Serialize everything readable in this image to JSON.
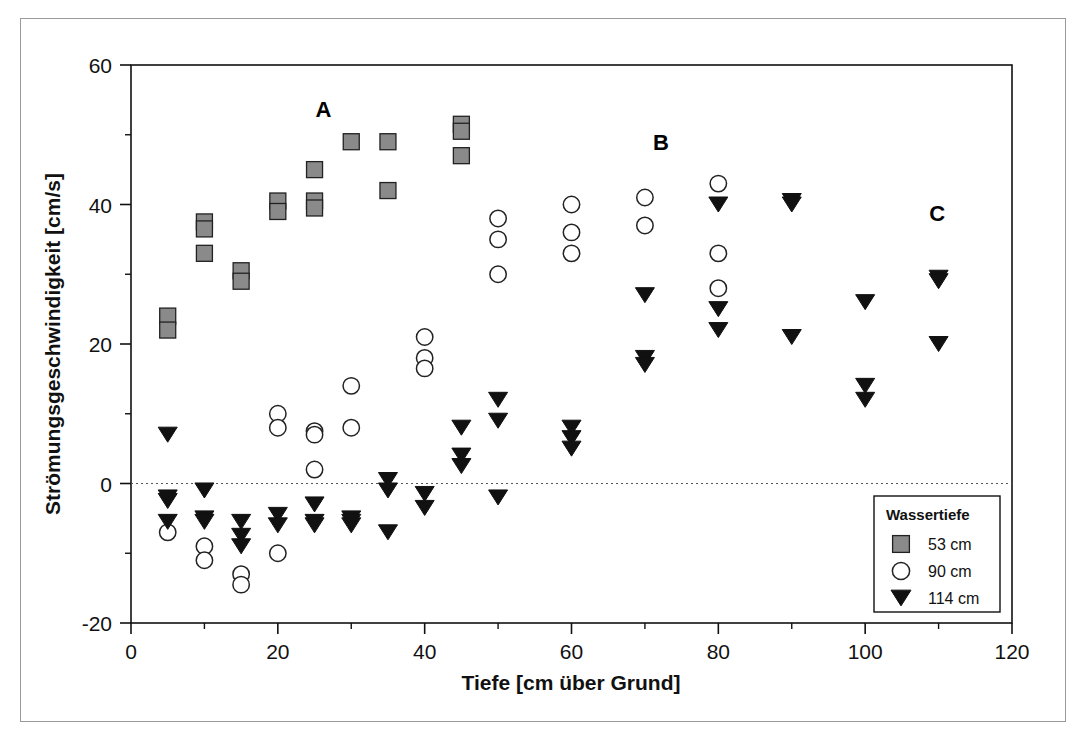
{
  "chart_data": {
    "type": "scatter",
    "title": "",
    "xlabel": "Tiefe [cm über Grund]",
    "ylabel": "Strömungsgeschwindigkeit [cm/s]",
    "xlim": [
      0,
      120
    ],
    "ylim": [
      -20,
      60
    ],
    "xticks": [
      0,
      20,
      40,
      60,
      80,
      100,
      120
    ],
    "xtick_labels": [
      "0",
      "20",
      "40",
      "60",
      "80",
      "100",
      "120"
    ],
    "xminor_ticks": [
      10,
      30,
      50,
      70,
      90,
      110
    ],
    "yticks": [
      -20,
      0,
      20,
      40,
      60
    ],
    "ytick_labels": [
      "-20",
      "0",
      "20",
      "40",
      "60"
    ],
    "yminor_ticks": [
      -10,
      10,
      30,
      50
    ],
    "grid": false,
    "zero_line": {
      "value": 0,
      "style": "dotted",
      "color": "#555555"
    },
    "legend": {
      "position": "bottom-right",
      "title": "Wassertiefe",
      "entries": [
        {
          "label": "53 cm",
          "marker": "square",
          "fill": "#8a8a8a",
          "stroke": "#222222"
        },
        {
          "label": "90 cm",
          "marker": "circle",
          "fill": "#ffffff",
          "stroke": "#222222"
        },
        {
          "label": "114 cm",
          "marker": "triangle-down",
          "fill": "#111111",
          "stroke": "#111111"
        }
      ]
    },
    "annotations": [
      {
        "text": "A",
        "x": 26.2,
        "y": 52.5
      },
      {
        "text": "B",
        "x": 72.2,
        "y": 47.8
      },
      {
        "text": "C",
        "x": 109.8,
        "y": 37.7
      }
    ],
    "series": [
      {
        "name": "53 cm",
        "marker": "square",
        "fill": "#8a8a8a",
        "stroke": "#222222",
        "points": [
          [
            5,
            24
          ],
          [
            5,
            22
          ],
          [
            10,
            37.5
          ],
          [
            10,
            36.5
          ],
          [
            10,
            33
          ],
          [
            15,
            30.5
          ],
          [
            15,
            29
          ],
          [
            20,
            40.5
          ],
          [
            20,
            39
          ],
          [
            25,
            45
          ],
          [
            25,
            40.5
          ],
          [
            25,
            39.5
          ],
          [
            30,
            49
          ],
          [
            35,
            49
          ],
          [
            35,
            42
          ],
          [
            45,
            51.5
          ],
          [
            45,
            50.5
          ],
          [
            45,
            47
          ]
        ]
      },
      {
        "name": "90 cm",
        "marker": "circle",
        "fill": "#ffffff",
        "stroke": "#222222",
        "points": [
          [
            5,
            -7
          ],
          [
            10,
            -9
          ],
          [
            10,
            -11
          ],
          [
            15,
            -13
          ],
          [
            15,
            -14.5
          ],
          [
            20,
            10
          ],
          [
            20,
            8
          ],
          [
            20,
            -10
          ],
          [
            25,
            7.5
          ],
          [
            25,
            7
          ],
          [
            25,
            2
          ],
          [
            30,
            14
          ],
          [
            30,
            8
          ],
          [
            40,
            21
          ],
          [
            40,
            18
          ],
          [
            40,
            16.5
          ],
          [
            50,
            38
          ],
          [
            50,
            35
          ],
          [
            50,
            30
          ],
          [
            60,
            40
          ],
          [
            60,
            36
          ],
          [
            60,
            33
          ],
          [
            70,
            41
          ],
          [
            70,
            37
          ],
          [
            80,
            43
          ],
          [
            80,
            33
          ],
          [
            80,
            28
          ]
        ]
      },
      {
        "name": "114 cm",
        "marker": "triangle-down",
        "fill": "#111111",
        "stroke": "#111111",
        "points": [
          [
            5,
            7
          ],
          [
            5,
            -2
          ],
          [
            5,
            -2.5
          ],
          [
            5,
            -5.5
          ],
          [
            10,
            -1
          ],
          [
            10,
            -5
          ],
          [
            10,
            -5.5
          ],
          [
            15,
            -5.5
          ],
          [
            15,
            -7.5
          ],
          [
            15,
            -9
          ],
          [
            20,
            -4.5
          ],
          [
            20,
            -6
          ],
          [
            25,
            -3
          ],
          [
            25,
            -5.5
          ],
          [
            25,
            -6
          ],
          [
            30,
            -5
          ],
          [
            30,
            -5.5
          ],
          [
            30,
            -6
          ],
          [
            35,
            0.5
          ],
          [
            35,
            -1
          ],
          [
            35,
            -7
          ],
          [
            40,
            -1.5
          ],
          [
            40,
            -3.5
          ],
          [
            45,
            8
          ],
          [
            45,
            4
          ],
          [
            45,
            2.5
          ],
          [
            50,
            12
          ],
          [
            50,
            9
          ],
          [
            50,
            -2
          ],
          [
            60,
            8
          ],
          [
            60,
            6.5
          ],
          [
            60,
            5
          ],
          [
            70,
            27
          ],
          [
            70,
            18
          ],
          [
            70,
            17
          ],
          [
            80,
            40
          ],
          [
            80,
            25
          ],
          [
            80,
            22
          ],
          [
            90,
            40.5
          ],
          [
            90,
            40
          ],
          [
            90,
            21
          ],
          [
            100,
            26
          ],
          [
            100,
            14
          ],
          [
            100,
            12
          ],
          [
            110,
            29.5
          ],
          [
            110,
            29
          ],
          [
            110,
            20
          ]
        ]
      }
    ]
  },
  "figure": {
    "frame_color": "#9a9a9a",
    "axis_color": "#111111"
  }
}
